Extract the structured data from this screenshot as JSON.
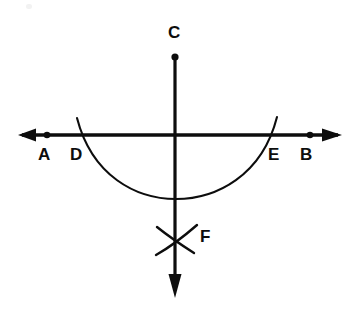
{
  "figure": {
    "background_color": "#ffffff",
    "stroke_color": "#0d0d0d",
    "labels": [
      {
        "name": "label-c",
        "text": "C",
        "x": 168,
        "y": 24
      },
      {
        "name": "label-a",
        "text": "A",
        "x": 38,
        "y": 146
      },
      {
        "name": "label-d",
        "text": "D",
        "x": 70,
        "y": 146
      },
      {
        "name": "label-e",
        "text": "E",
        "x": 268,
        "y": 146
      },
      {
        "name": "label-b",
        "text": "B",
        "x": 300,
        "y": 146
      },
      {
        "name": "label-f",
        "text": "F",
        "x": 200,
        "y": 228
      }
    ],
    "lines": [
      {
        "name": "horizontal-line-ab",
        "x1": 22,
        "y1": 135,
        "x2": 338,
        "y2": 135,
        "arrow_start": true,
        "arrow_end": true
      },
      {
        "name": "vertical-line-cf",
        "x1": 175,
        "y1": 56,
        "x2": 175,
        "y2": 296,
        "arrow_start": false,
        "arrow_end": true
      }
    ],
    "points": [
      {
        "name": "point-c",
        "x": 175,
        "y": 57,
        "r": 3.4
      },
      {
        "name": "point-a",
        "x": 47,
        "y": 135,
        "r": 3.2
      },
      {
        "name": "point-b",
        "x": 310,
        "y": 135,
        "r": 3.2
      },
      {
        "name": "point-origin",
        "x": 175,
        "y": 135,
        "r": 0
      }
    ],
    "arcs": [
      {
        "name": "main-arc-de",
        "description": "downward arc from above D through lowest point on vertical line to above E",
        "path": "M 77 118 C 92 176 136 199 176 199 C 216 199 262 176 277 117"
      },
      {
        "name": "cross-arc-left-f",
        "description": "short arc stroke of X mark at F, upper-left to lower-right",
        "path": "M 157 228 Q 171 238 192 252"
      },
      {
        "name": "cross-arc-right-f",
        "description": "short arc stroke of X mark at F, lower-left to upper-right",
        "path": "M 157 254 Q 174 244 196 226"
      }
    ],
    "annotations": {
      "arc_intersect_left_x": 82,
      "arc_intersect_right_x": 270,
      "arc_bottom_y": 172,
      "intersection": {
        "x": 175,
        "y": 135
      }
    }
  }
}
